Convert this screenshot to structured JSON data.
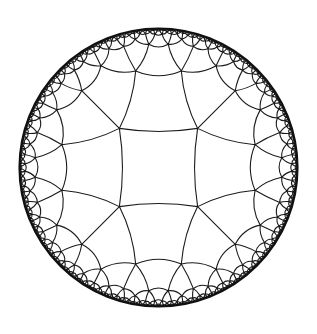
{
  "diagram": {
    "title": "Hyperbolic {4,5} tiling (Poincaré disk)",
    "model": "poincare-disk",
    "schlafli": {
      "p": 4,
      "q": 5
    },
    "disk": {
      "cx": 158.5,
      "cy": 167.5,
      "r": 139
    },
    "central_tile_rotation_deg": 45,
    "colors": {
      "background": "#ffffff",
      "edge": "#1a1a1a",
      "boundary": "#111111"
    },
    "edge_width": 1.1,
    "boundary_width": 2.2,
    "min_tile_size_px": 1.6
  }
}
